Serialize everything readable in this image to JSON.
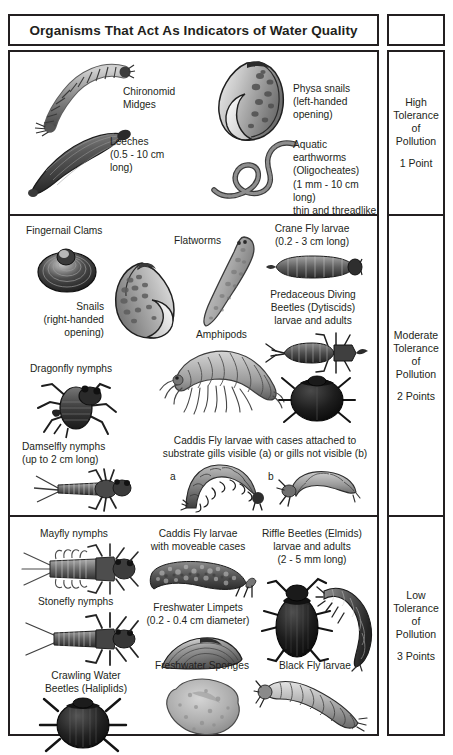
{
  "title": "Organisms That Act As Indicators of Water Quality",
  "sections": [
    {
      "id": "high",
      "tolerance": {
        "line1": "High",
        "line2": "Tolerance",
        "line3": "of",
        "line4": "Pollution",
        "points": "1 Point"
      },
      "organisms": [
        {
          "name": "chironomid-midges",
          "caption": "Chironomid\nMidges"
        },
        {
          "name": "leeches",
          "caption": "Leeches\n(0.5 - 10 cm\nlong)"
        },
        {
          "name": "physa-snails",
          "caption": "Physa snails\n(left-handed\nopening)"
        },
        {
          "name": "aquatic-earthworms",
          "caption": "Aquatic earthworms\n(Oligocheates)\n(1 mm - 10 cm long)\nthin and threadlike"
        }
      ]
    },
    {
      "id": "moderate",
      "tolerance": {
        "line1": "Moderate",
        "line2": "Tolerance",
        "line3": "of",
        "line4": "Pollution",
        "points": "2 Points"
      },
      "organisms": [
        {
          "name": "fingernail-clams",
          "caption": "Fingernail Clams"
        },
        {
          "name": "snails-right-handed",
          "caption": "Snails\n(right-handed\nopening)"
        },
        {
          "name": "dragonfly-nymphs",
          "caption": "Dragonfly nymphs"
        },
        {
          "name": "damselfly-nymphs",
          "caption": "Damselfly nymphs\n(up to 2 cm long)"
        },
        {
          "name": "flatworms",
          "caption": "Flatworms"
        },
        {
          "name": "amphipods",
          "caption": "Amphipods"
        },
        {
          "name": "crane-fly-larvae",
          "caption": "Crane Fly larvae\n(0.2 - 3 cm long)"
        },
        {
          "name": "predaceous-diving-beetles",
          "caption": "Predaceous Diving\nBeetles (Dytiscids)\nlarvae and adults"
        },
        {
          "name": "caddis-fly-larvae-attached",
          "caption": "Caddis Fly larvae with cases attached to\nsubstrate gills visible (a) or gills not visible (b)"
        }
      ],
      "sublabels": {
        "a": "a",
        "b": "b"
      }
    },
    {
      "id": "low",
      "tolerance": {
        "line1": "Low",
        "line2": "Tolerance",
        "line3": "of",
        "line4": "Pollution",
        "points": "3 Points"
      },
      "organisms": [
        {
          "name": "mayfly-nymphs",
          "caption": "Mayfly nymphs"
        },
        {
          "name": "stonefly-nymphs",
          "caption": "Stonefly nymphs"
        },
        {
          "name": "crawling-water-beetles",
          "caption": "Crawling Water\nBeetles (Haliplids)"
        },
        {
          "name": "caddis-fly-larvae-moveable",
          "caption": "Caddis Fly larvae\nwith moveable cases"
        },
        {
          "name": "freshwater-limpets",
          "caption": "Freshwater Limpets\n(0.2 - 0.4 cm diameter)"
        },
        {
          "name": "freshwater-sponges",
          "caption": "Freshwater Sponges"
        },
        {
          "name": "riffle-beetles",
          "caption": "Riffle Beetles (Elmids)\nlarvae and adults\n(2 - 5 mm long)"
        },
        {
          "name": "black-fly-larvae",
          "caption": "Black Fly larvae"
        }
      ]
    }
  ],
  "colors": {
    "ink": "#231f20",
    "paper": "#ffffff",
    "art_dark": "#2b2b2b",
    "art_mid": "#8a8a8a",
    "art_light": "#d4d4d4"
  }
}
